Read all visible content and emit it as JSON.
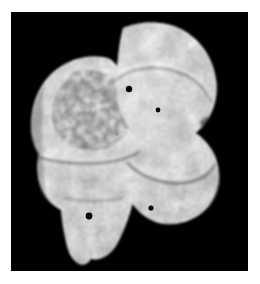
{
  "page": {
    "background_color": "#ffffff",
    "width": 260,
    "height": 284,
    "caption": ""
  },
  "photo": {
    "background_color": "#000000",
    "frame": {
      "x": 11,
      "y": 12,
      "width": 237,
      "height": 259
    },
    "subject": "fossil bone specimen",
    "subject_description": "Grayscale photograph of a mottled fossil bone fragment with two rounded condylar lobes on the right and a broad flat blade extending to the left, photographed against a plain black background",
    "color_mode": "grayscale",
    "tone_light": "#e8e8e8",
    "tone_mid": "#9a9a9a",
    "tone_dark": "#4a4a4a",
    "tone_darkest": "#2a2a2a"
  },
  "specimen": {
    "parts": [
      {
        "name": "upper-condyle",
        "label": "Upper rounded condyle",
        "position": "top-right",
        "tone": "#c8c8c8"
      },
      {
        "name": "lower-condyle",
        "label": "Lower rounded condyle",
        "position": "mid-right",
        "tone": "#c0c0c0"
      },
      {
        "name": "left-blade",
        "label": "Broad left blade",
        "position": "left",
        "tone": "#a8a8a8"
      },
      {
        "name": "inferior-process",
        "label": "Inferior narrow process",
        "position": "bottom-left",
        "tone": "#b0b0b0"
      },
      {
        "name": "dark-mottle-patch",
        "label": "Dark mottled staining patch",
        "position": "upper-left",
        "tone": "#3c3c3c"
      }
    ],
    "foramina": [
      {
        "name": "foramen-1",
        "cx": 118,
        "cy": 77,
        "r": 3.2
      },
      {
        "name": "foramen-2",
        "cx": 147,
        "cy": 98,
        "r": 2.4
      },
      {
        "name": "foramen-3",
        "cx": 78,
        "cy": 204,
        "r": 3.4
      },
      {
        "name": "foramen-4",
        "cx": 140,
        "cy": 196,
        "r": 2.6
      }
    ],
    "sutures": [
      {
        "name": "transverse-suture",
        "label": "Transverse suture line across left blade"
      },
      {
        "name": "condyle-ridge",
        "label": "Curved ridge on upper condyle"
      },
      {
        "name": "condyle-groove",
        "label": "Curved groove on lower condyle"
      }
    ]
  }
}
